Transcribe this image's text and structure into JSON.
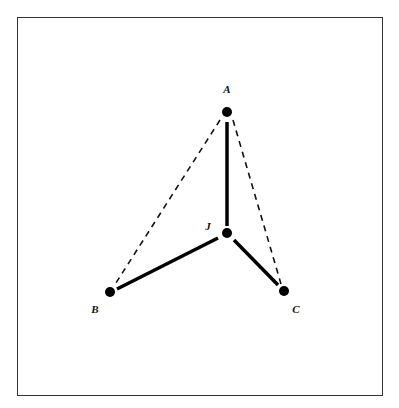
{
  "diagram": {
    "frame": {
      "x": 17,
      "y": 17,
      "width": 366,
      "height": 379,
      "stroke": "#333333"
    },
    "nodes": [
      {
        "id": "A",
        "label": "A",
        "x": 227,
        "y": 112,
        "label_x": 227,
        "label_y": 93
      },
      {
        "id": "J",
        "label": "J",
        "x": 227,
        "y": 233,
        "label_x": 208,
        "label_y": 230
      },
      {
        "id": "B",
        "label": "B",
        "x": 110,
        "y": 292,
        "label_x": 95,
        "label_y": 313
      },
      {
        "id": "C",
        "label": "C",
        "x": 284,
        "y": 291,
        "label_x": 296,
        "label_y": 313
      }
    ],
    "edges": [
      {
        "from": "A",
        "to": "J",
        "style": "solid"
      },
      {
        "from": "J",
        "to": "B",
        "style": "solid"
      },
      {
        "from": "J",
        "to": "C",
        "style": "solid"
      },
      {
        "from": "A",
        "to": "B",
        "style": "dashed"
      },
      {
        "from": "A",
        "to": "C",
        "style": "dashed"
      }
    ]
  }
}
